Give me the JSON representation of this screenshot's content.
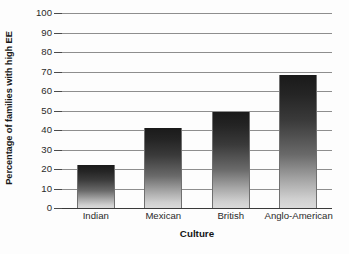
{
  "chart_data": {
    "type": "bar",
    "title": "",
    "subtitle": "",
    "xlabel": "Culture",
    "ylabel": "Percentage of families with high EE",
    "categories": [
      "Indian",
      "Mexican",
      "British",
      "Anglo-American"
    ],
    "values": [
      22,
      41,
      49,
      68
    ],
    "series": [
      {
        "name": "Percentage of families with high EE",
        "values": [
          22,
          41,
          49,
          68
        ]
      }
    ],
    "ylim": [
      0,
      100
    ],
    "y_ticks": [
      0,
      10,
      20,
      30,
      40,
      50,
      60,
      70,
      80,
      90,
      100
    ],
    "y_tick_labels": [
      "0",
      "10",
      "20",
      "30",
      "40",
      "50",
      "60",
      "70",
      "80",
      "90",
      "100"
    ],
    "grid": "horizontal",
    "legend": "none",
    "annotations": [],
    "bar_style": {
      "fill": "vertical-gradient-grayscale",
      "top_color": "#1a1a1a",
      "bottom_color": "#dadada",
      "edge_color": "#707070"
    },
    "axis_style": {
      "left_spine": false,
      "right_spine": false,
      "top_spine": false,
      "baseline_color": "#3a3a3a",
      "gridline_color": "#8e8e8e"
    }
  },
  "figure": {
    "background_color": "#fdfdfd",
    "text_color": "#1d1d1d"
  }
}
